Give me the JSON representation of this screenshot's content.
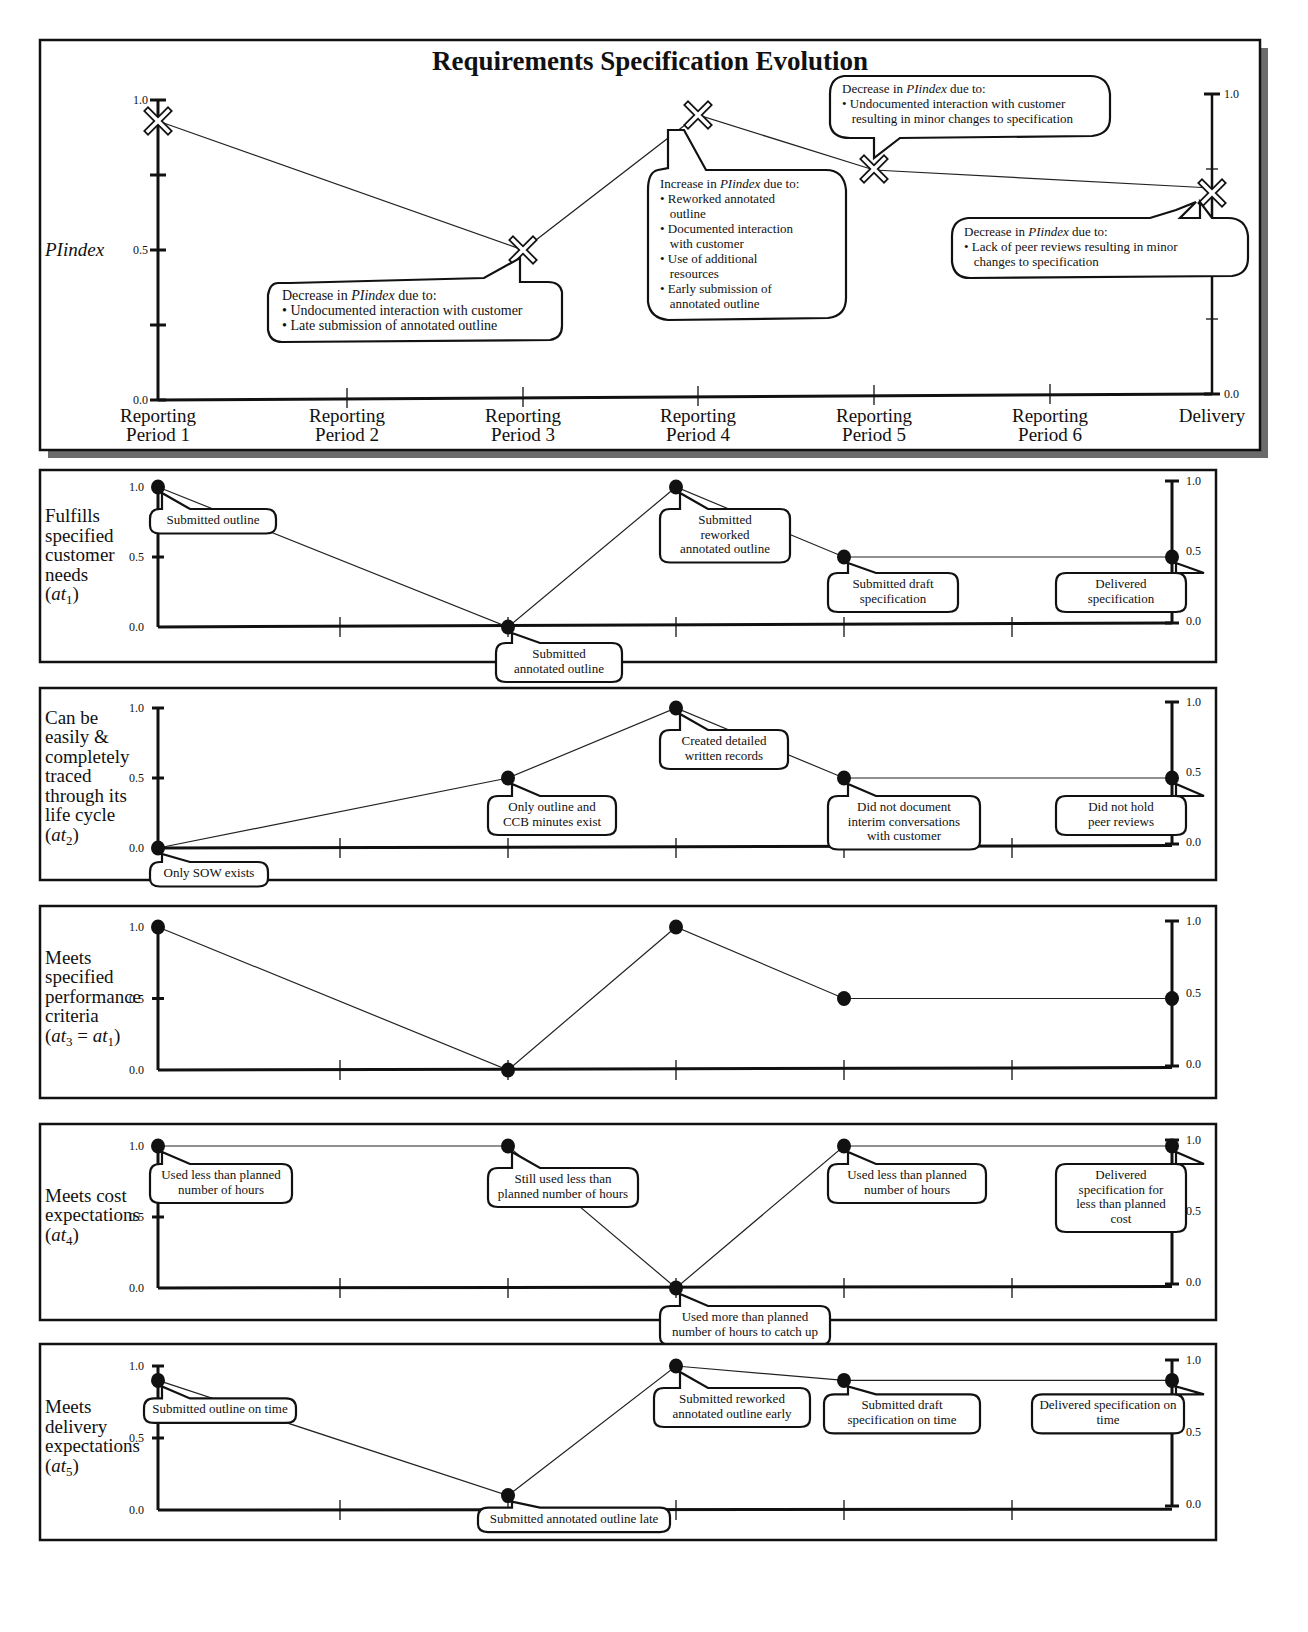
{
  "title": "Requirements Specification Evolution",
  "x_categories": [
    "Reporting Period 1",
    "Reporting Period 2",
    "Reporting Period 3",
    "Reporting Period 4",
    "Reporting Period 5",
    "Reporting Period 6",
    "Delivery"
  ],
  "y_ticks": [
    "0.0",
    "0.5",
    "1.0"
  ],
  "chart_data": [
    {
      "type": "line",
      "title": "Requirements Specification Evolution",
      "ylabel": "PIindex",
      "xlabel": "",
      "marker": "x",
      "categories": [
        "Reporting Period 1",
        "Reporting Period 2",
        "Reporting Period 3",
        "Reporting Period 4",
        "Reporting Period 5",
        "Reporting Period 6",
        "Delivery"
      ],
      "points": [
        {
          "x": "Reporting Period 1",
          "y": 0.93
        },
        {
          "x": "Reporting Period 3",
          "y": 0.5
        },
        {
          "x": "Reporting Period 4",
          "y": 0.95
        },
        {
          "x": "Reporting Period 5",
          "y": 0.77
        },
        {
          "x": "Delivery",
          "y": 0.71
        }
      ],
      "ylim": [
        0,
        1
      ],
      "yticks": [
        0.0,
        0.5,
        1.0
      ],
      "grid": false,
      "annotations": [
        {
          "at": "Reporting Period 3",
          "heading": "Decrease in PIindex due to:",
          "bullets": [
            "Undocumented interaction with customer",
            "Late submission of annotated outline"
          ]
        },
        {
          "at": "Reporting Period 4",
          "heading": "Increase in PIindex due to:",
          "bullets": [
            "Reworked annotated outline",
            "Documented interaction with customer",
            "Use of additional resources",
            "Early submission of annotated outline"
          ]
        },
        {
          "at": "Reporting Period 5",
          "heading": "Decrease in PIindex due to:",
          "bullets": [
            "Undocumented interaction with customer resulting in minor changes to specification"
          ]
        },
        {
          "at": "Delivery",
          "heading": "Decrease in PIindex due to:",
          "bullets": [
            "Lack of peer reviews resulting in minor changes to specification"
          ]
        }
      ]
    },
    {
      "type": "line",
      "ylabel": "Fulfills specified customer needs (at1)",
      "marker": "dot",
      "points": [
        {
          "x": "Reporting Period 1",
          "y": 1.0,
          "note": "Submitted outline"
        },
        {
          "x": "Reporting Period 3",
          "y": 0.0,
          "note": "Submitted annotated outline"
        },
        {
          "x": "Reporting Period 4",
          "y": 1.0,
          "note": "Submitted reworked annotated outline"
        },
        {
          "x": "Reporting Period 5",
          "y": 0.5,
          "note": "Submitted draft specification"
        },
        {
          "x": "Delivery",
          "y": 0.5,
          "note": "Delivered specification"
        }
      ],
      "ylim": [
        0,
        1
      ],
      "yticks": [
        0.0,
        0.5,
        1.0
      ]
    },
    {
      "type": "line",
      "ylabel": "Can be easily & completely traced through its life cycle (at2)",
      "marker": "dot",
      "points": [
        {
          "x": "Reporting Period 1",
          "y": 0.0,
          "note": "Only SOW exists"
        },
        {
          "x": "Reporting Period 3",
          "y": 0.5,
          "note": "Only outline and CCB minutes exist"
        },
        {
          "x": "Reporting Period 4",
          "y": 1.0,
          "note": "Created detailed written records"
        },
        {
          "x": "Reporting Period 5",
          "y": 0.5,
          "note": "Did not document interim conversations with customer"
        },
        {
          "x": "Delivery",
          "y": 0.5,
          "note": "Did not hold peer reviews"
        }
      ],
      "ylim": [
        0,
        1
      ],
      "yticks": [
        0.0,
        0.5,
        1.0
      ]
    },
    {
      "type": "line",
      "ylabel": "Meets specified performance criteria (at3 = at1)",
      "marker": "dot",
      "points": [
        {
          "x": "Reporting Period 1",
          "y": 1.0
        },
        {
          "x": "Reporting Period 3",
          "y": 0.0
        },
        {
          "x": "Reporting Period 4",
          "y": 1.0
        },
        {
          "x": "Reporting Period 5",
          "y": 0.5
        },
        {
          "x": "Delivery",
          "y": 0.5
        }
      ],
      "ylim": [
        0,
        1
      ],
      "yticks": [
        0.0,
        0.5,
        1.0
      ]
    },
    {
      "type": "line",
      "ylabel": "Meets cost expectations (at4)",
      "marker": "dot",
      "points": [
        {
          "x": "Reporting Period 1",
          "y": 1.0,
          "note": "Used less than planned number of hours"
        },
        {
          "x": "Reporting Period 3",
          "y": 1.0,
          "note": "Still used less than planned number of hours"
        },
        {
          "x": "Reporting Period 4",
          "y": 0.0,
          "note": "Used more than planned number of hours to catch up"
        },
        {
          "x": "Reporting Period 5",
          "y": 1.0,
          "note": "Used less than planned number of hours"
        },
        {
          "x": "Delivery",
          "y": 1.0,
          "note": "Delivered specification for less than planned cost"
        }
      ],
      "ylim": [
        0,
        1
      ],
      "yticks": [
        0.0,
        0.5,
        1.0
      ]
    },
    {
      "type": "line",
      "ylabel": "Meets delivery expectations (at5)",
      "marker": "dot",
      "points": [
        {
          "x": "Reporting Period 1",
          "y": 0.9,
          "note": "Submitted outline on time"
        },
        {
          "x": "Reporting Period 3",
          "y": 0.1,
          "note": "Submitted annotated outline late"
        },
        {
          "x": "Reporting Period 4",
          "y": 1.0,
          "note": "Submitted reworked annotated outline early"
        },
        {
          "x": "Reporting Period 5",
          "y": 0.9,
          "note": "Submitted draft specification on time"
        },
        {
          "x": "Delivery",
          "y": 0.9,
          "note": "Delivered specification on time"
        }
      ],
      "ylim": [
        0,
        1
      ],
      "yticks": [
        0.0,
        0.5,
        1.0
      ]
    }
  ],
  "main": {
    "ylabel": "PIindex",
    "x_labels": [
      [
        "Reporting",
        "Period 1"
      ],
      [
        "Reporting",
        "Period 2"
      ],
      [
        "Reporting",
        "Period 3"
      ],
      [
        "Reporting",
        "Period 4"
      ],
      [
        "Reporting",
        "Period 5"
      ],
      [
        "Reporting",
        "Period 6"
      ],
      [
        "Delivery"
      ]
    ],
    "callouts": [
      {
        "heading_pre": "Decrease in ",
        "heading_em": "PIindex",
        "heading_post": " due to:",
        "lines": [
          "• Undocumented interaction with customer",
          "• Late submission of annotated outline"
        ]
      },
      {
        "heading_pre": "Increase in ",
        "heading_em": "PIindex",
        "heading_post": " due to:",
        "lines": [
          "• Reworked annotated",
          "   outline",
          "• Documented interaction",
          "   with customer",
          "• Use of additional",
          "   resources",
          "• Early submission of",
          "   annotated outline"
        ]
      },
      {
        "heading_pre": "Decrease in ",
        "heading_em": "PIindex",
        "heading_post": " due to:",
        "lines": [
          "• Undocumented interaction with customer",
          "   resulting in minor changes to specification"
        ]
      },
      {
        "heading_pre": "Decrease in ",
        "heading_em": "PIindex",
        "heading_post": " due to:",
        "lines": [
          "• Lack of peer reviews resulting in minor",
          "   changes to specification"
        ]
      }
    ]
  },
  "panels": [
    {
      "label_lines": [
        "Fulfills",
        "specified",
        "customer",
        "needs"
      ],
      "sub": "1",
      "sub_suffix": "",
      "notes": [
        [
          "Submitted outline"
        ],
        [
          "Submitted",
          "annotated outline"
        ],
        [
          "Submitted",
          "reworked",
          "annotated outline"
        ],
        [
          "Submitted draft",
          "specification"
        ],
        [
          "Delivered",
          "specification"
        ]
      ]
    },
    {
      "label_lines": [
        "Can be",
        "easily &",
        "completely",
        "traced",
        "through its",
        "life cycle"
      ],
      "sub": "2",
      "sub_suffix": "",
      "notes": [
        [
          "Only SOW exists"
        ],
        [
          "Only outline and",
          "CCB minutes exist"
        ],
        [
          "Created detailed",
          "written records"
        ],
        [
          "Did not document",
          "interim conversations",
          "with customer"
        ],
        [
          "Did not hold",
          "peer reviews"
        ]
      ]
    },
    {
      "label_lines": [
        "Meets",
        "specified",
        "performance",
        "criteria"
      ],
      "sub": "3",
      "sub_suffix": " = at1",
      "notes": []
    },
    {
      "label_lines": [
        "Meets cost",
        "expectations"
      ],
      "sub": "4",
      "sub_suffix": "",
      "notes": [
        [
          "Used less than planned",
          "number of hours"
        ],
        [
          "Still used less than",
          "planned number of hours"
        ],
        [
          "Used more than planned",
          "number of hours to catch up"
        ],
        [
          "Used less than planned",
          "number of hours"
        ],
        [
          "Delivered",
          "specification for",
          "less than planned",
          "cost"
        ]
      ]
    },
    {
      "label_lines": [
        "Meets",
        "delivery",
        "expectations"
      ],
      "sub": "5",
      "sub_suffix": "",
      "notes": [
        [
          "Submitted outline on time"
        ],
        [
          "Submitted annotated outline late"
        ],
        [
          "Submitted reworked",
          "annotated outline early"
        ],
        [
          "Submitted draft",
          "specification on time"
        ],
        [
          "Delivered specification on",
          "time"
        ]
      ]
    }
  ]
}
